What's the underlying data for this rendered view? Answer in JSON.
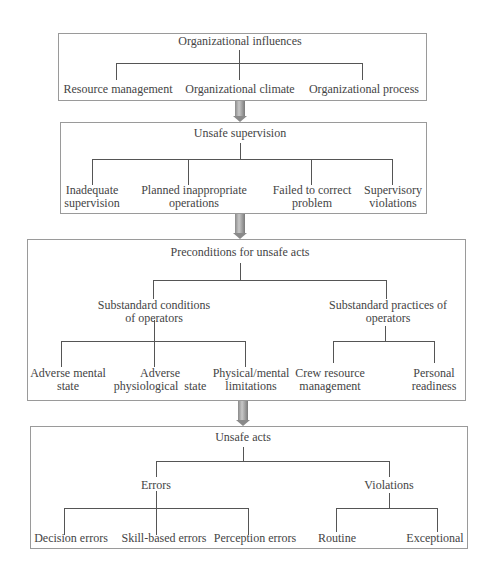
{
  "diagram": {
    "level1": {
      "title": "Organizational influences",
      "children": [
        "Resource management",
        "Organizational climate",
        "Organizational process"
      ]
    },
    "level2": {
      "title": "Unsafe supervision",
      "children": [
        {
          "line1": "Inadequate",
          "line2": "supervision"
        },
        {
          "line1": "Planned inappropriate",
          "line2": "operations"
        },
        {
          "line1": "Failed to correct",
          "line2": "problem"
        },
        {
          "line1": "Supervisory",
          "line2": "violations"
        }
      ]
    },
    "level3": {
      "title": "Preconditions for unsafe acts",
      "groups": [
        {
          "line1": "Substandard conditions",
          "line2": "of operators",
          "children": [
            {
              "line1": "Adverse mental",
              "line2": "state"
            },
            {
              "line1": "Adverse",
              "line2": "physiological  state"
            },
            {
              "line1": "Physical/mental",
              "line2": "limitations"
            }
          ]
        },
        {
          "line1": "Substandard practices of",
          "line2": "operators",
          "children": [
            {
              "line1": "Crew resource",
              "line2": "management"
            },
            {
              "line1": "Personal",
              "line2": "readiness"
            }
          ]
        }
      ]
    },
    "level4": {
      "title": "Unsafe acts",
      "groups": [
        {
          "label": "Errors",
          "children": [
            "Decision errors",
            "Skill-based errors",
            "Perception errors"
          ]
        },
        {
          "label": "Violations",
          "children": [
            "Routine",
            "Exceptional"
          ]
        }
      ]
    }
  }
}
